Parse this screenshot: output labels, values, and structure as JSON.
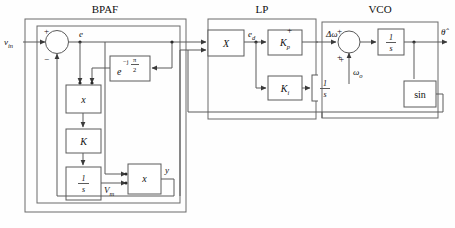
{
  "figure": {
    "type": "block-diagram"
  },
  "groups": [
    {
      "id": "bpaf",
      "title": "BPAF"
    },
    {
      "id": "lp",
      "title": "LP"
    },
    {
      "id": "vco",
      "title": "VCO"
    }
  ],
  "signals": {
    "input": "v",
    "input_sub": "in",
    "error": "e",
    "detector_out": "e",
    "detector_out_sub": "d",
    "delta_omega": "Δω",
    "omega_nominal": "ω",
    "omega_nominal_sub": "o",
    "theta_hat": "θ̂",
    "vm": "V",
    "vm_sub": "m",
    "y": "y"
  },
  "blocks": {
    "mult_x1": "x",
    "mult_x2": "x",
    "mult_big": "X",
    "gain_k": "K",
    "integrator_bpaf_num": "1",
    "integrator_bpaf_den": "s",
    "phase_shift_base": "e",
    "phase_shift_exp_sign": "−j",
    "phase_shift_exp_num": "π",
    "phase_shift_exp_den": "2",
    "kp": "K",
    "kp_sub": "p",
    "ki": "K",
    "ki_sub": "i",
    "integrator_lp_num": "1",
    "integrator_lp_den": "s",
    "integrator_vco_num": "1",
    "integrator_vco_den": "s",
    "sine": "sin"
  },
  "sum_signs": {
    "bpaf_plus": "+",
    "bpaf_minus": "−",
    "lp_plus_top": "+",
    "lp_plus_bottom": "+",
    "vco_plus_top": "+",
    "vco_plus_bottom": "+"
  },
  "colors": {
    "line": "#5a5a5a",
    "box_fill": "#ffffff",
    "text": "#111111",
    "background": "#fefefe"
  }
}
